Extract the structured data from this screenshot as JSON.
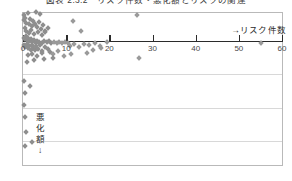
{
  "figure": {
    "title": "図表 2.3.2　リスク件数・悪化額とリスクの関連"
  },
  "legend": {
    "risk_count_label": "→リスク件数"
  },
  "ylabel": {
    "chars": [
      "悪",
      "化",
      "額",
      "↓"
    ]
  },
  "chart_data": {
    "type": "scatter",
    "title": "図表 2.3.2　リスク件数・悪化額とリスクの関連",
    "xlabel": "→リスク件数",
    "ylabel": "悪化額↓",
    "xlim": [
      0,
      60
    ],
    "ylim": [
      0,
      4.5
    ],
    "y_inverted": true,
    "grid": true,
    "gridlines_y": [
      1,
      2,
      3
    ],
    "legend_position": "top-right",
    "xticks": [
      0,
      10,
      20,
      30,
      40,
      50,
      60
    ],
    "xticklabels": [
      "0",
      "10",
      "20",
      "30",
      "40",
      "50",
      "60"
    ],
    "marker": "diamond",
    "marker_color": "#9a9a9a",
    "axis_color": "#2b2b2b",
    "grid_color": "#d8d8d8",
    "frame_color": "#b9b9b9",
    "series": [
      {
        "name": "リスク件数・悪化額",
        "points": [
          [
            0.2,
            -0.78
          ],
          [
            0.3,
            -0.62
          ],
          [
            0.5,
            -0.7
          ],
          [
            0.8,
            -0.55
          ],
          [
            1.1,
            -0.85
          ],
          [
            1.4,
            -0.5
          ],
          [
            1.7,
            -0.66
          ],
          [
            2.0,
            -0.45
          ],
          [
            2.4,
            -0.6
          ],
          [
            2.8,
            -0.52
          ],
          [
            3.2,
            -0.42
          ],
          [
            3.6,
            -0.58
          ],
          [
            4.1,
            -0.35
          ],
          [
            4.6,
            -0.47
          ],
          [
            5.2,
            -0.3
          ],
          [
            5.8,
            -0.4
          ],
          [
            1.0,
            -0.95
          ],
          [
            2.2,
            -0.92
          ],
          [
            3.0,
            -0.88
          ],
          [
            4.0,
            -0.8
          ],
          [
            0.4,
            -0.38
          ],
          [
            0.7,
            -0.3
          ],
          [
            1.3,
            -0.25
          ],
          [
            1.9,
            -0.33
          ],
          [
            2.6,
            -0.22
          ],
          [
            3.4,
            -0.28
          ],
          [
            4.3,
            -0.18
          ],
          [
            5.0,
            -0.26
          ],
          [
            0.15,
            -0.1
          ],
          [
            0.35,
            -0.05
          ],
          [
            0.6,
            -0.14
          ],
          [
            0.9,
            -0.02
          ],
          [
            1.2,
            -0.09
          ],
          [
            1.5,
            0.0
          ],
          [
            1.8,
            -0.06
          ],
          [
            2.1,
            0.02
          ],
          [
            2.5,
            -0.04
          ],
          [
            2.9,
            0.05
          ],
          [
            3.3,
            -0.01
          ],
          [
            3.8,
            0.03
          ],
          [
            4.4,
            0.06
          ],
          [
            4.9,
            0.01
          ],
          [
            5.5,
            0.04
          ],
          [
            6.1,
            0.0
          ],
          [
            6.6,
            0.05
          ],
          [
            7.2,
            0.02
          ],
          [
            7.8,
            0.07
          ],
          [
            8.4,
            0.03
          ],
          [
            9.0,
            0.06
          ],
          [
            9.7,
            0.02
          ],
          [
            10.4,
            0.05
          ],
          [
            0.25,
            0.12
          ],
          [
            0.55,
            0.18
          ],
          [
            0.85,
            0.1
          ],
          [
            1.15,
            0.22
          ],
          [
            1.45,
            0.15
          ],
          [
            1.75,
            0.26
          ],
          [
            2.05,
            0.13
          ],
          [
            2.35,
            0.2
          ],
          [
            2.7,
            0.28
          ],
          [
            3.1,
            0.16
          ],
          [
            3.5,
            0.24
          ],
          [
            3.9,
            0.11
          ],
          [
            4.5,
            0.3
          ],
          [
            5.1,
            0.19
          ],
          [
            5.7,
            0.25
          ],
          [
            1.05,
            0.42
          ],
          [
            2.15,
            0.38
          ],
          [
            3.25,
            0.46
          ],
          [
            4.35,
            0.35
          ],
          [
            6.3,
            0.33
          ],
          [
            7.0,
            0.4
          ],
          [
            8.1,
            0.3
          ],
          [
            2.3,
            -1.35
          ],
          [
            4.2,
            -1.28
          ],
          [
            5.4,
            -1.15
          ],
          [
            7.5,
            -1.05
          ],
          [
            1.6,
            -1.55
          ],
          [
            3.7,
            -1.45
          ],
          [
            8.8,
            -0.95
          ],
          [
            0.9,
            0.62
          ],
          [
            2.6,
            0.58
          ],
          [
            4.8,
            0.55
          ],
          [
            6.9,
            0.5
          ],
          [
            9.4,
            0.45
          ],
          [
            11.2,
            0.4
          ],
          [
            10.8,
            0.15
          ],
          [
            11.8,
            0.1
          ],
          [
            12.9,
            0.18
          ],
          [
            14.2,
            0.08
          ],
          [
            15.3,
            0.12
          ],
          [
            16.6,
            0.06
          ],
          [
            17.9,
            0.14
          ],
          [
            19.4,
            0.04
          ],
          [
            14.8,
            0.35
          ],
          [
            16.2,
            0.28
          ],
          [
            18.1,
            0.22
          ],
          [
            11.5,
            -0.6
          ],
          [
            13.4,
            -0.3
          ],
          [
            26.3,
            -0.78
          ],
          [
            26.8,
            0.52
          ],
          [
            55.2,
            0.06
          ],
          [
            0.3,
            1.18
          ],
          [
            0.5,
            1.55
          ],
          [
            0.2,
            1.92
          ],
          [
            0.4,
            2.28
          ],
          [
            1.6,
            1.35
          ],
          [
            0.6,
            2.72
          ],
          [
            2.0,
            3.02
          ],
          [
            0.35,
            3.12
          ]
        ]
      }
    ]
  }
}
